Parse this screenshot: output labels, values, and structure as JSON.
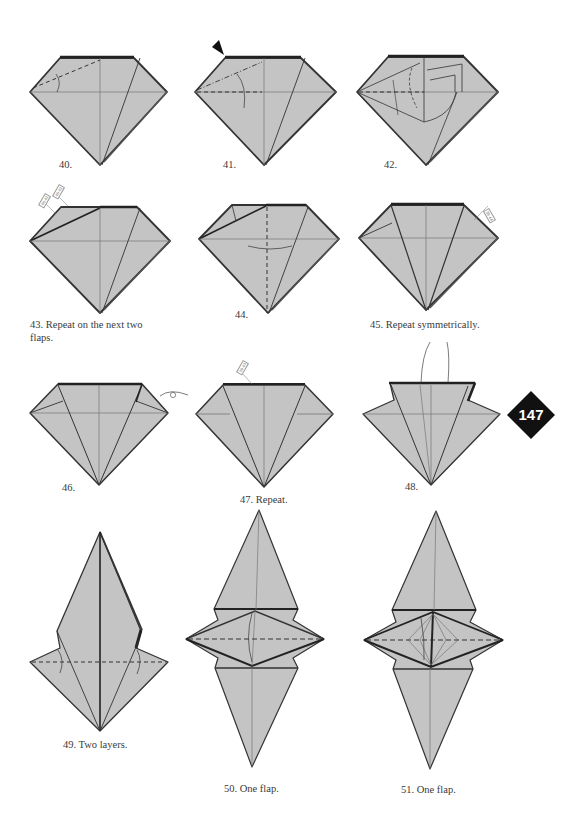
{
  "page": {
    "page_number": "147",
    "colors": {
      "paper": "#c4c4c4",
      "edge": "#333333",
      "crease": "#777777",
      "badge": "#111111",
      "background": "#ffffff"
    }
  },
  "steps": [
    {
      "number": "40.",
      "caption": "40."
    },
    {
      "number": "41.",
      "caption": "41."
    },
    {
      "number": "42.",
      "caption": "42."
    },
    {
      "number": "43.",
      "caption": "43. Repeat on the next two flaps."
    },
    {
      "number": "44.",
      "caption": "44."
    },
    {
      "number": "45.",
      "caption": "45. Repeat symmetrically."
    },
    {
      "number": "46.",
      "caption": "46."
    },
    {
      "number": "47.",
      "caption": "47. Repeat."
    },
    {
      "number": "48.",
      "caption": "48."
    },
    {
      "number": "49.",
      "caption": "49. Two layers."
    },
    {
      "number": "50.",
      "caption": "50. One flap."
    },
    {
      "number": "51.",
      "caption": "51. One flap."
    }
  ],
  "tags": {
    "step43_a": "40-42",
    "step43_b": "40-42",
    "step45": "39-44",
    "step47": "39-43"
  }
}
